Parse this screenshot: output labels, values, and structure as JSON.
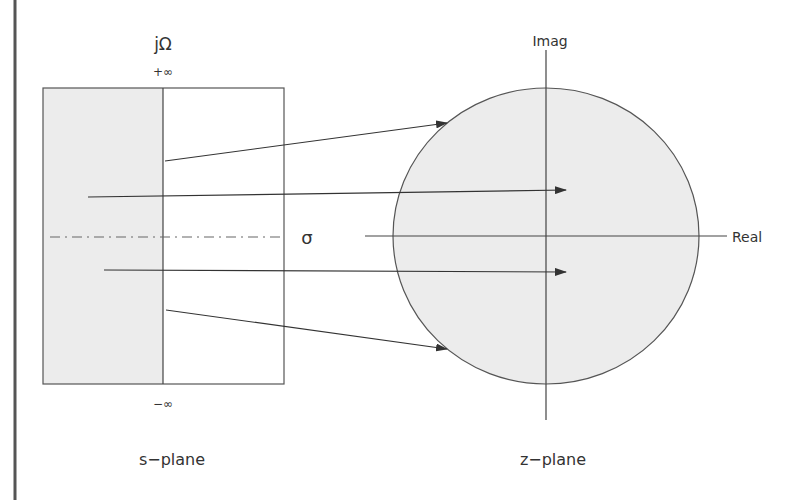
{
  "colors": {
    "line": "#444444",
    "fill": "#ececec",
    "text": "#333333",
    "border": "#555555"
  },
  "s_plane": {
    "title": "s−plane",
    "vertical_axis_label": "jΩ",
    "top_label": "+∞",
    "bottom_label": "−∞",
    "horizontal_axis_label": "σ"
  },
  "z_plane": {
    "title": "z−plane",
    "vertical_axis_label": "Imag",
    "horizontal_axis_label": "Real"
  },
  "mappings": [
    {
      "from": [
        165,
        161
      ],
      "to": [
        447,
        123
      ]
    },
    {
      "from": [
        88,
        197
      ],
      "to": [
        566,
        190
      ]
    },
    {
      "from": [
        104,
        270
      ],
      "to": [
        566,
        272
      ]
    },
    {
      "from": [
        166,
        310
      ],
      "to": [
        447,
        349
      ]
    }
  ]
}
